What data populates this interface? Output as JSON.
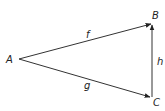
{
  "diagram": {
    "type": "directed-graph-triangle",
    "vertices": [
      {
        "id": "A",
        "label": "A",
        "x": 18,
        "y": 59
      },
      {
        "id": "B",
        "label": "B",
        "x": 152,
        "y": 24
      },
      {
        "id": "C",
        "label": "C",
        "x": 152,
        "y": 97
      }
    ],
    "edges": [
      {
        "id": "f",
        "label": "f",
        "from": "A",
        "to": "B"
      },
      {
        "id": "g",
        "label": "g",
        "from": "A",
        "to": "C"
      },
      {
        "id": "h",
        "label": "h",
        "from": "C",
        "to": "B"
      }
    ],
    "colors": {
      "stroke": "#333333",
      "text": "#222222",
      "background": "#ffffff"
    }
  }
}
